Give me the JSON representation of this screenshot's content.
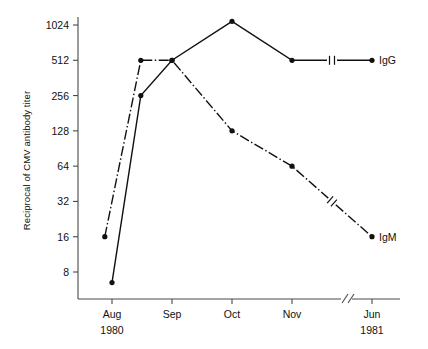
{
  "chart_data": {
    "type": "line",
    "title": "",
    "xlabel": "",
    "ylabel": "Reciprocal of CMV antibody titer",
    "yscale": "log2",
    "ylim": [
      8,
      1024
    ],
    "yticks": [
      8,
      16,
      32,
      64,
      128,
      256,
      512,
      1024
    ],
    "ytick_labels": [
      "8",
      "16",
      "32",
      "64",
      "128",
      "256",
      "512",
      "1024"
    ],
    "x_categories": [
      "Aug",
      "Sep",
      "Oct",
      "Nov",
      "Jun"
    ],
    "x_sublabels": [
      "1980",
      "",
      "",
      "",
      "1981"
    ],
    "x_axis_break_between": [
      "Nov",
      "Jun"
    ],
    "grid": false,
    "legend_position": "right-of-line-ends",
    "series": [
      {
        "name": "IgG",
        "label": "IgG",
        "linestyle": "solid",
        "color": "#111111",
        "marker": "filled-circle",
        "points": [
          {
            "x_label": "early-Aug",
            "x": 0.0,
            "y": 6.5
          },
          {
            "x_label": "late-Aug",
            "x": 0.12,
            "y": 256
          },
          {
            "x_label": "Sep",
            "x": 0.25,
            "y": 512
          },
          {
            "x_label": "Oct",
            "x": 0.5,
            "y": 1100
          },
          {
            "x_label": "Nov",
            "x": 0.75,
            "y": 512
          },
          {
            "x_label": "Jun",
            "x": 1.0,
            "y": 512
          }
        ]
      },
      {
        "name": "IgM",
        "label": "IgM",
        "linestyle": "dash-dot",
        "color": "#111111",
        "marker": "filled-circle",
        "points": [
          {
            "x_label": "early-Aug",
            "x": -0.03,
            "y": 16
          },
          {
            "x_label": "late-Aug",
            "x": 0.12,
            "y": 512
          },
          {
            "x_label": "Sep",
            "x": 0.25,
            "y": 512
          },
          {
            "x_label": "Oct",
            "x": 0.5,
            "y": 128
          },
          {
            "x_label": "Nov",
            "x": 0.75,
            "y": 64
          },
          {
            "x_label": "Jun",
            "x": 1.0,
            "y": 16
          }
        ]
      }
    ],
    "annotations": [
      {
        "kind": "axis-break",
        "axis": "x",
        "note": "double-slash between Nov and Jun"
      },
      {
        "kind": "line-break",
        "series": "IgG",
        "note": "break mark on Nov-Jun segment"
      },
      {
        "kind": "line-break",
        "series": "IgM",
        "note": "break mark on Nov-Jun segment"
      }
    ]
  },
  "ui": {
    "series_labels": {
      "igg": "IgG",
      "igm": "IgM"
    }
  }
}
